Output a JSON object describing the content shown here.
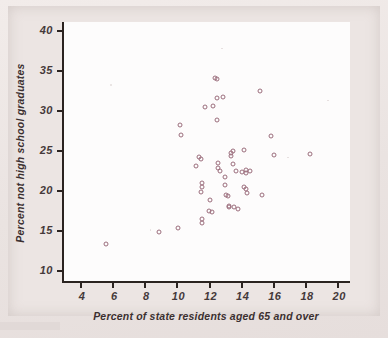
{
  "figure": {
    "kind": "scatterplot",
    "axis_title_x": "Percent of state residents aged 65 and over",
    "axis_title_y": "Percent not high school graduates"
  },
  "chart_data": {
    "type": "scatter",
    "title": "",
    "subtitle": "",
    "xlabel": "Percent of state residents aged 65 and over",
    "ylabel": "Percent not high school graduates",
    "xlim": [
      3.0,
      20.8
    ],
    "ylim": [
      8.6,
      41.0
    ],
    "xticks": [
      4,
      6,
      8,
      10,
      12,
      14,
      16,
      18,
      20
    ],
    "yticks": [
      10,
      15,
      20,
      25,
      30,
      35,
      40
    ],
    "xtick_labels": [
      "4",
      "6",
      "8",
      "10",
      "12",
      "14",
      "16",
      "18",
      "20"
    ],
    "ytick_labels": [
      "10",
      "15",
      "20",
      "25",
      "30",
      "35",
      "40"
    ],
    "grid": false,
    "legend": false,
    "legend_position": "none",
    "marker": "open-circle",
    "marker_color": "#9b6d7c",
    "n_points": 51,
    "points": [
      [
        5.6,
        13.2
      ],
      [
        8.9,
        14.7
      ],
      [
        10.1,
        15.2
      ],
      [
        10.2,
        28.1
      ],
      [
        10.3,
        26.9
      ],
      [
        11.2,
        23.0
      ],
      [
        11.4,
        24.1
      ],
      [
        11.5,
        23.9
      ],
      [
        11.5,
        19.7
      ],
      [
        11.6,
        20.9
      ],
      [
        11.6,
        20.3
      ],
      [
        11.6,
        16.3
      ],
      [
        11.6,
        15.8
      ],
      [
        11.8,
        30.4
      ],
      [
        12.0,
        17.3
      ],
      [
        12.1,
        18.7
      ],
      [
        12.2,
        17.2
      ],
      [
        12.3,
        30.5
      ],
      [
        12.4,
        34.0
      ],
      [
        12.5,
        33.9
      ],
      [
        12.5,
        28.8
      ],
      [
        12.5,
        31.5
      ],
      [
        12.6,
        23.4
      ],
      [
        12.6,
        22.7
      ],
      [
        12.7,
        22.3
      ],
      [
        12.9,
        31.6
      ],
      [
        13.0,
        20.6
      ],
      [
        13.0,
        21.6
      ],
      [
        13.1,
        19.4
      ],
      [
        13.2,
        19.2
      ],
      [
        13.3,
        18.0
      ],
      [
        13.3,
        17.8
      ],
      [
        13.4,
        24.6
      ],
      [
        13.4,
        24.2
      ],
      [
        13.5,
        24.9
      ],
      [
        13.5,
        23.2
      ],
      [
        13.6,
        17.9
      ],
      [
        13.7,
        22.4
      ],
      [
        13.8,
        17.6
      ],
      [
        14.1,
        22.2
      ],
      [
        14.2,
        25.0
      ],
      [
        14.2,
        20.4
      ],
      [
        14.3,
        22.5
      ],
      [
        14.3,
        22.1
      ],
      [
        14.3,
        20.1
      ],
      [
        14.4,
        19.6
      ],
      [
        14.6,
        22.4
      ],
      [
        15.2,
        32.4
      ],
      [
        15.3,
        19.3
      ],
      [
        15.9,
        26.8
      ],
      [
        16.1,
        24.4
      ],
      [
        18.3,
        24.5
      ]
    ]
  }
}
